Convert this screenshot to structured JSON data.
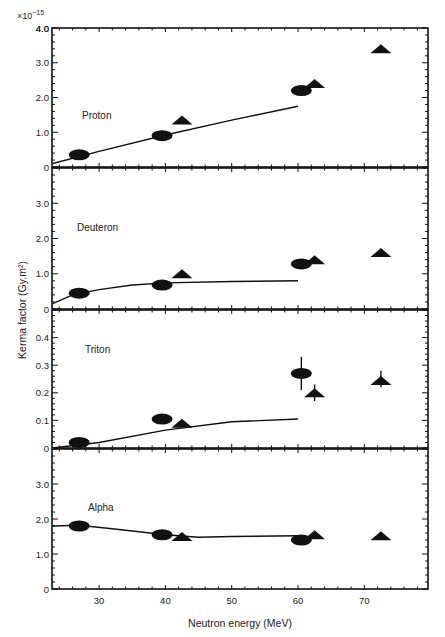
{
  "figure": {
    "multiplier": "×10",
    "multiplier_exp": "−15",
    "ylabel": "Kerma factor (Gy.m²)",
    "xlabel": "Neutron energy (MeV)"
  },
  "chart_data": [
    {
      "type": "scatter",
      "title": "Proton",
      "xlabel": "Neutron energy (MeV)",
      "ylabel": "Kerma factor (Gy.m²) ×10⁻¹⁵",
      "xlim": [
        23,
        79.5
      ],
      "ylim": [
        0,
        4.0
      ],
      "yticks": [
        0,
        1.0,
        2.0,
        3.0,
        4.0
      ],
      "ytick_labels": [
        "0",
        "1.0",
        "2.0",
        "3.0",
        "4.0"
      ],
      "series": [
        {
          "name": "measured (circles)",
          "marker": "ellipse",
          "x": [
            27,
            39.5,
            60.5
          ],
          "y": [
            0.35,
            0.9,
            2.2
          ]
        },
        {
          "name": "measured (triangles)",
          "marker": "triangle",
          "x": [
            42.5,
            62.5,
            72.5
          ],
          "y": [
            1.35,
            2.4,
            3.4
          ]
        },
        {
          "name": "calculation",
          "marker": "line",
          "x": [
            23,
            30,
            40,
            50,
            60
          ],
          "y": [
            0.1,
            0.45,
            0.92,
            1.35,
            1.75
          ]
        }
      ]
    },
    {
      "type": "scatter",
      "title": "Deuteron",
      "xlim": [
        23,
        79.5
      ],
      "ylim": [
        0,
        4.0
      ],
      "yticks": [
        0,
        1.0,
        2.0,
        3.0
      ],
      "ytick_labels": [
        "0",
        "1.0",
        "2.0",
        "3.0"
      ],
      "series": [
        {
          "name": "measured (circles)",
          "marker": "ellipse",
          "x": [
            27,
            39.5,
            60.5
          ],
          "y": [
            0.45,
            0.68,
            1.28
          ]
        },
        {
          "name": "measured (triangles)",
          "marker": "triangle",
          "x": [
            42.5,
            62.5,
            72.5
          ],
          "y": [
            1.0,
            1.4,
            1.6
          ]
        },
        {
          "name": "calculation",
          "marker": "line",
          "x": [
            23,
            26,
            30,
            35,
            40,
            50,
            60
          ],
          "y": [
            0.15,
            0.4,
            0.55,
            0.68,
            0.74,
            0.78,
            0.8
          ]
        }
      ]
    },
    {
      "type": "scatter",
      "title": "Triton",
      "xlim": [
        23,
        79.5
      ],
      "ylim": [
        0,
        0.5
      ],
      "yticks": [
        0,
        0.1,
        0.2,
        0.3,
        0.4
      ],
      "ytick_labels": [
        "0",
        "0.1",
        "0.2",
        "0.3",
        "0.4"
      ],
      "series": [
        {
          "name": "measured (circles)",
          "marker": "ellipse",
          "x": [
            27,
            39.5,
            60.5
          ],
          "y": [
            0.02,
            0.105,
            0.27
          ],
          "err_low": [
            null,
            null,
            0.21
          ],
          "err_high": [
            null,
            null,
            0.33
          ]
        },
        {
          "name": "measured (triangles)",
          "marker": "triangle",
          "x": [
            42.5,
            62.5,
            72.5
          ],
          "y": [
            0.09,
            0.2,
            0.245
          ],
          "err_low": [
            null,
            0.17,
            0.22
          ],
          "err_high": [
            null,
            0.23,
            0.28
          ]
        },
        {
          "name": "calculation",
          "marker": "line",
          "x": [
            23,
            30,
            40,
            50,
            60
          ],
          "y": [
            0.0,
            0.02,
            0.065,
            0.095,
            0.105
          ]
        }
      ]
    },
    {
      "type": "scatter",
      "title": "Alpha",
      "xlim": [
        23,
        79.5
      ],
      "ylim": [
        0,
        4.0
      ],
      "yticks": [
        0,
        1.0,
        2.0,
        3.0
      ],
      "ytick_labels": [
        "0",
        "1.0",
        "2.0",
        "3.0"
      ],
      "xticks": [
        30,
        40,
        50,
        60,
        70
      ],
      "xtick_labels": [
        "30",
        "40",
        "50",
        "60",
        "70"
      ],
      "series": [
        {
          "name": "measured (circles)",
          "marker": "ellipse",
          "x": [
            27,
            39.5,
            60.5
          ],
          "y": [
            1.8,
            1.55,
            1.4
          ]
        },
        {
          "name": "measured (triangles)",
          "marker": "triangle",
          "x": [
            42.5,
            62.5,
            72.5
          ],
          "y": [
            1.5,
            1.55,
            1.52
          ]
        },
        {
          "name": "calculation",
          "marker": "line",
          "x": [
            23,
            27,
            33,
            40,
            45,
            50,
            60
          ],
          "y": [
            1.8,
            1.82,
            1.7,
            1.55,
            1.48,
            1.5,
            1.52
          ]
        }
      ]
    }
  ]
}
